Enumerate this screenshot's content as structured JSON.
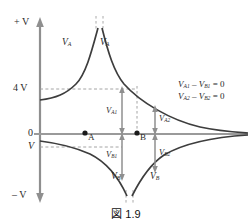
{
  "figure": {
    "caption": "図 1.9",
    "colors": {
      "curve": "#3d3d3d",
      "axis": "#8c8c8c",
      "dashed": "#9a9a9a",
      "arrow": "#8f8f8f",
      "text": "#2a2a2a"
    }
  },
  "axis": {
    "top_label": "+ V",
    "bottom_label": "– V",
    "tick_4v": "4 V",
    "tick_zero": "0",
    "tick_v": "V"
  },
  "curves": {
    "va_left_label": "V",
    "va_left_sub": "A",
    "va_right_label": "V",
    "va_right_sub": "A",
    "vb_left_label": "V",
    "vb_left_sub": "B",
    "vb_right_label": "V",
    "vb_right_sub": "B"
  },
  "points": {
    "a_label": "A",
    "b_label": "B"
  },
  "measures": {
    "va1": "V",
    "va1_sub": "A1",
    "va2": "V",
    "va2_sub": "A2",
    "vb1": "V",
    "vb1_sub": "B1",
    "vb2": "V",
    "vb2_sub": "B2"
  },
  "equations": {
    "line1_v1": "V",
    "line1_sub1": "A1",
    "line1_minus": " – ",
    "line1_v2": "V",
    "line1_sub2": "B1",
    "line1_eq": " = 0",
    "line2_v1": "V",
    "line2_sub1": "A2",
    "line2_minus": " – ",
    "line2_v2": "V",
    "line2_sub2": "B2",
    "line2_eq": " = 0"
  },
  "geometry": {
    "zero_y": 134,
    "four_v_y": 89,
    "v_neg_y": 147,
    "asymptote_x": 99,
    "point_a_x": 85,
    "point_b_x": 137
  }
}
